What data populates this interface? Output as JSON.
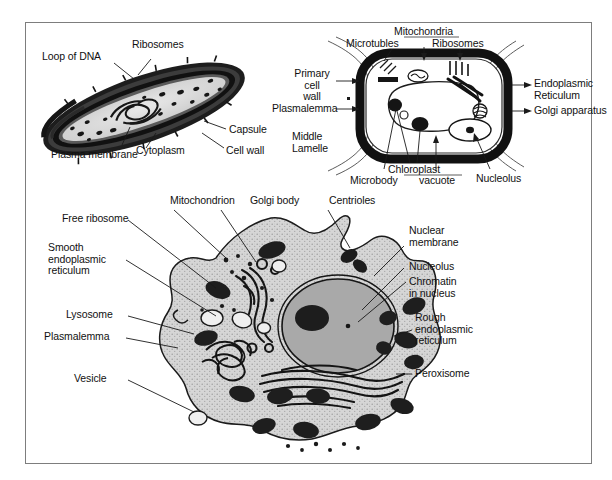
{
  "figure": {
    "panels": [
      "bacterial-cell",
      "plant-cell",
      "animal-cell"
    ]
  },
  "bacterial_cell": {
    "name": "Bacterial cell",
    "labels": [
      {
        "id": "loop-of-dna",
        "text": "Loop of DNA"
      },
      {
        "id": "ribosomes",
        "text": "Ribosomes"
      },
      {
        "id": "plasma-membrane",
        "text": "Plasma membrane"
      },
      {
        "id": "cytoplasm",
        "text": "Cytoplasm"
      },
      {
        "id": "capsule",
        "text": "Capsule"
      },
      {
        "id": "cell-wall",
        "text": "Cell wall"
      }
    ]
  },
  "plant_cell": {
    "name": "Plant cell",
    "labels": [
      {
        "id": "mitochondria",
        "text": "Mitochondria"
      },
      {
        "id": "microtubles",
        "text": "Microtubles"
      },
      {
        "id": "ribosomes",
        "text": "Ribosomes"
      },
      {
        "id": "primary-cell-wall",
        "text": "Primary cell\nwall"
      },
      {
        "id": "plasmalemma",
        "text": "Plasmalemma"
      },
      {
        "id": "middle-lamelle",
        "text": "Middle\nLamelle"
      },
      {
        "id": "endoplasmic-reticulum",
        "text": "Endoplasmic\nReticulum"
      },
      {
        "id": "golgi-apparatus",
        "text": "Golgi apparatus"
      },
      {
        "id": "chloroplast",
        "text": "Chloroplast"
      },
      {
        "id": "microbody",
        "text": "Microbody"
      },
      {
        "id": "vacuote",
        "text": "vacuote"
      },
      {
        "id": "nucleolus",
        "text": "Nucleolus"
      }
    ]
  },
  "animal_cell": {
    "name": "Animal cell",
    "labels": [
      {
        "id": "mitochondrion",
        "text": "Mitochondrion"
      },
      {
        "id": "golgi-body",
        "text": "Golgi body"
      },
      {
        "id": "centrioles",
        "text": "Centrioles"
      },
      {
        "id": "free-ribosome",
        "text": "Free ribosome"
      },
      {
        "id": "smooth-er",
        "text": "Smooth\nendoplasmic\nreticulum"
      },
      {
        "id": "lysosome",
        "text": "Lysosome"
      },
      {
        "id": "plasmalemma",
        "text": "Plasmalemma"
      },
      {
        "id": "vesicle",
        "text": "Vesicle"
      },
      {
        "id": "nuclear-membrane",
        "text": "Nuclear\nmembrane"
      },
      {
        "id": "nucleolus",
        "text": "Nucleolus"
      },
      {
        "id": "chromatin",
        "text": "Chromatin\nin nucleus"
      },
      {
        "id": "rough-er",
        "text": "Rough\nendoplasmic\nreticulum"
      },
      {
        "id": "peroxisome",
        "text": "Peroxisome"
      }
    ]
  },
  "colors": {
    "frame": "#7d7d7d",
    "ink": "#1a1a1a",
    "cytoplasm": "#d4d4d4",
    "nucleus": "#a8a8a8",
    "organelle_dark": "#232323",
    "background": "#ffffff"
  }
}
